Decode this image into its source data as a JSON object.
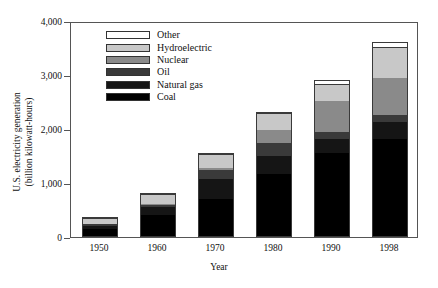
{
  "chart_data": {
    "type": "bar",
    "subtype": "stacked-column",
    "title": "",
    "xlabel": "Year",
    "ylabel": "U.S. electricity generation (billion kilowatt-hours)",
    "ylabel_line1": "U.S. electricity generation",
    "ylabel_line2": "(billion kilowatt-hours)",
    "categories": [
      "1950",
      "1960",
      "1970",
      "1980",
      "1990",
      "1998"
    ],
    "ylim": [
      0,
      4000
    ],
    "ytick_labels": [
      "0",
      "1,000",
      "2,000",
      "3,000",
      "4,000"
    ],
    "ytick_values": [
      0,
      1000,
      2000,
      3000,
      4000
    ],
    "grid": false,
    "legend_position": "upper-left-inside",
    "stack_order_bottom_to_top": [
      "Coal",
      "Natural gas",
      "Oil",
      "Nuclear",
      "Hydroelectric",
      "Other"
    ],
    "series": [
      {
        "name": "Coal",
        "color": "#000000",
        "values": [
          155,
          400,
          700,
          1160,
          1560,
          1810
        ]
      },
      {
        "name": "Natural gas",
        "color": "#151515",
        "values": [
          45,
          160,
          370,
          340,
          260,
          320
        ]
      },
      {
        "name": "Oil",
        "color": "#3a3a3a",
        "values": [
          35,
          50,
          180,
          240,
          120,
          130
        ]
      },
      {
        "name": "Nuclear",
        "color": "#8a8a8a",
        "values": [
          0,
          10,
          20,
          250,
          580,
          680
        ]
      },
      {
        "name": "Hydroelectric",
        "color": "#c8c8c8",
        "values": [
          100,
          150,
          250,
          280,
          300,
          560
        ]
      },
      {
        "name": "Other",
        "color": "#ffffff",
        "values": [
          5,
          10,
          10,
          20,
          90,
          120
        ]
      }
    ],
    "totals": [
      340,
      780,
      1530,
      2290,
      2910,
      3620
    ],
    "legend_entries": [
      {
        "label": "Other",
        "color": "#ffffff"
      },
      {
        "label": "Hydroelectric",
        "color": "#c8c8c8"
      },
      {
        "label": "Nuclear",
        "color": "#8a8a8a"
      },
      {
        "label": "Oil",
        "color": "#3a3a3a"
      },
      {
        "label": "Natural gas",
        "color": "#151515"
      },
      {
        "label": "Coal",
        "color": "#000000"
      }
    ]
  }
}
